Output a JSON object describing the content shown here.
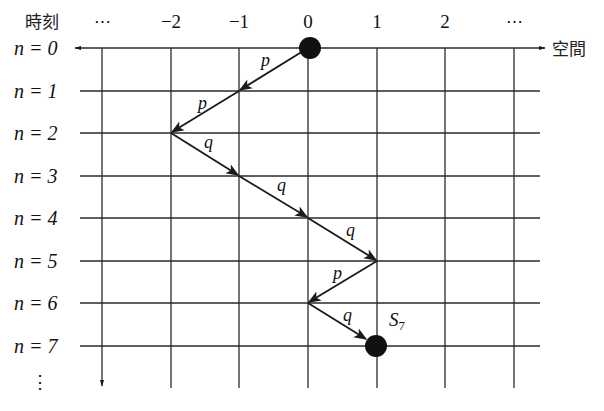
{
  "axes": {
    "time_label": "時刻",
    "space_label": "空間",
    "column_labels": [
      "⋯",
      "−2",
      "−1",
      "0",
      "1",
      "2",
      "⋯"
    ],
    "row_labels": [
      "n = 0",
      "n = 1",
      "n = 2",
      "n = 3",
      "n = 4",
      "n = 5",
      "n = 6",
      "n = 7"
    ],
    "row_continuation": "⋮"
  },
  "walk": {
    "start_position": 0,
    "end_label": "S",
    "end_subscript": "7",
    "steps": [
      {
        "from": [
          0,
          0
        ],
        "to": [
          -1,
          1
        ],
        "label": "p"
      },
      {
        "from": [
          -1,
          1
        ],
        "to": [
          -2,
          2
        ],
        "label": "p"
      },
      {
        "from": [
          -2,
          2
        ],
        "to": [
          -1,
          3
        ],
        "label": "q"
      },
      {
        "from": [
          -1,
          3
        ],
        "to": [
          0,
          4
        ],
        "label": "q"
      },
      {
        "from": [
          0,
          4
        ],
        "to": [
          1,
          5
        ],
        "label": "q"
      },
      {
        "from": [
          1,
          5
        ],
        "to": [
          0,
          6
        ],
        "label": "p"
      },
      {
        "from": [
          0,
          6
        ],
        "to": [
          1,
          7
        ],
        "label": "q"
      }
    ]
  },
  "colors": {
    "line": "#2a2a2a",
    "dot": "#111111"
  }
}
